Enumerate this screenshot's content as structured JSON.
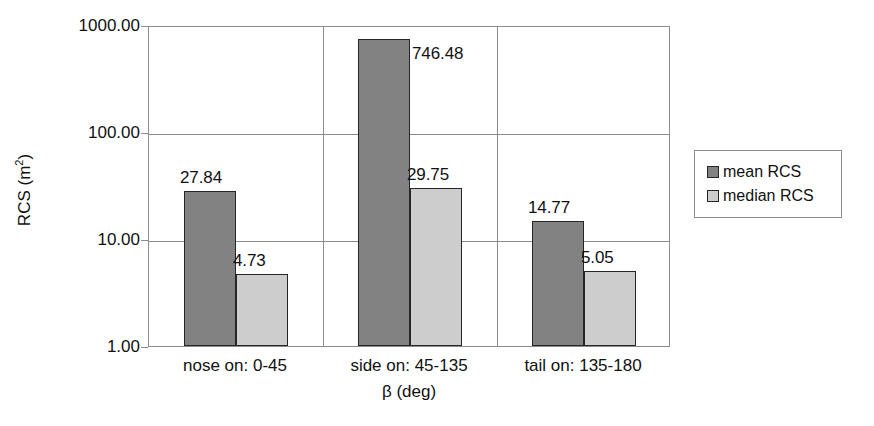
{
  "chart_data": {
    "type": "bar",
    "title": "",
    "xlabel": "β (deg)",
    "ylabel": "RCS (m²)",
    "ylabel_base": "RCS (m",
    "ylabel_sup": "2",
    "ylabel_close": ")",
    "yscale": "log",
    "ylim": [
      1,
      1000
    ],
    "grid": true,
    "legend_position": "right",
    "categories": [
      "nose on:  0-45",
      "side on: 45-135",
      "tail on: 135-180"
    ],
    "yticks": [
      "1.00",
      "10.00",
      "100.00",
      "1000.00"
    ],
    "ytick_values": [
      1,
      10,
      100,
      1000
    ],
    "series": [
      {
        "name": "mean RCS",
        "color": "#828282",
        "values": [
          27.84,
          746.48,
          14.77
        ],
        "labels": [
          "27.84",
          "746.48",
          "14.77"
        ]
      },
      {
        "name": "median RCS",
        "color": "#cdcdcd",
        "values": [
          4.73,
          29.75,
          5.05
        ],
        "labels": [
          "4.73",
          "29.75",
          "5.05"
        ]
      }
    ]
  },
  "legend": {
    "items": [
      {
        "label": "mean RCS",
        "swatch": "mean"
      },
      {
        "label": "median RCS",
        "swatch": "median"
      }
    ]
  },
  "colors": {
    "mean": "#828282",
    "median": "#cdcdcd",
    "grid": "#8c8c8c",
    "bar_outline": "#262626",
    "text": "#111111",
    "background": "#ffffff"
  }
}
